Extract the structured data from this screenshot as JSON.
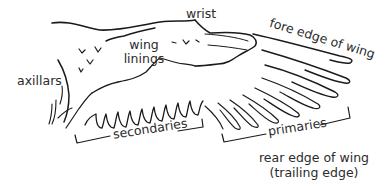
{
  "diagram": {
    "labels": {
      "wrist": "wrist",
      "fore_edge": "fore edge of wing",
      "wing_linings_1": "wing",
      "wing_linings_2": "linings",
      "axillars": "axillars",
      "secondaries": "secondaries",
      "primaries": "primaries",
      "rear_edge_1": "rear edge of wing",
      "rear_edge_2": "(trailing edge)"
    },
    "colors": {
      "line": "#1a1a1a",
      "text": "#2b2b2b",
      "background": "#ffffff"
    }
  }
}
